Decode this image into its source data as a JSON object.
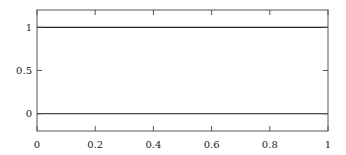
{
  "chart_data": {
    "type": "line",
    "title": "",
    "xlabel": "",
    "ylabel": "",
    "xlim": [
      0,
      1
    ],
    "ylim": [
      -0.2,
      1.2
    ],
    "grid": false,
    "legend": null,
    "x_ticks": [
      {
        "value": 0,
        "label": "0"
      },
      {
        "value": 0.2,
        "label": "0.2"
      },
      {
        "value": 0.4,
        "label": "0.4"
      },
      {
        "value": 0.6,
        "label": "0.6"
      },
      {
        "value": 0.8,
        "label": "0.8"
      },
      {
        "value": 1,
        "label": "1"
      }
    ],
    "y_ticks": [
      {
        "value": 0,
        "label": "0"
      },
      {
        "value": 0.5,
        "label": "0.5"
      },
      {
        "value": 1,
        "label": "1"
      }
    ],
    "series": [
      {
        "name": "y=1",
        "x": [
          0,
          1
        ],
        "y": [
          1,
          1
        ],
        "color": "#222222"
      },
      {
        "name": "y=0",
        "x": [
          0,
          1
        ],
        "y": [
          0,
          0
        ],
        "color": "#444444"
      }
    ]
  }
}
